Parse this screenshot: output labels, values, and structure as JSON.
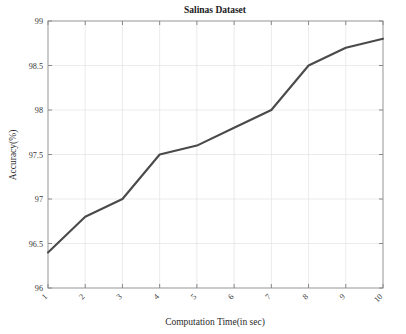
{
  "chart_data": {
    "type": "line",
    "title": "Salinas Dataset",
    "xlabel": "Computation Time(in sec)",
    "ylabel": "Accuracy(%)",
    "x": [
      1,
      2,
      3,
      4,
      5,
      6,
      7,
      8,
      9,
      10
    ],
    "values": [
      96.4,
      96.8,
      97.0,
      97.5,
      97.6,
      97.8,
      98.0,
      98.5,
      98.7,
      98.8
    ],
    "series": [
      {
        "name": "Accuracy",
        "values": [
          96.4,
          96.8,
          97.0,
          97.5,
          97.6,
          97.8,
          98.0,
          98.5,
          98.7,
          98.8
        ]
      }
    ],
    "xtick_labels": [
      "1",
      "2",
      "3",
      "4",
      "5",
      "6",
      "7",
      "8",
      "9",
      "10"
    ],
    "ytick_labels": [
      "96",
      "96.5",
      "97",
      "97.5",
      "98",
      "98.5",
      "99"
    ],
    "ytick_values": [
      96,
      96.5,
      97,
      97.5,
      98,
      98.5,
      99
    ],
    "xlim": [
      1,
      10
    ],
    "ylim": [
      96,
      99
    ],
    "grid": true,
    "legend": false,
    "xtick_rotation_deg": 45,
    "line_color": "#4a4a4a",
    "grid_color": "#e2e2e2",
    "axis_color": "#8a8a8a",
    "background_color": "#ffffff"
  }
}
